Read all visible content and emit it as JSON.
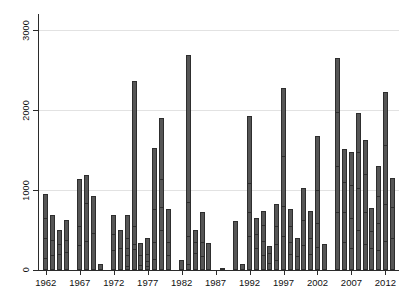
{
  "chart_data": {
    "type": "bar",
    "title": "",
    "subtitle": "",
    "xlabel": "",
    "ylabel": "",
    "grid": true,
    "legend": "none",
    "stacked": true,
    "xlim": [
      1961,
      2014
    ],
    "ylim": [
      0,
      3200
    ],
    "ytick_values": [
      0,
      1000,
      2000,
      3000
    ],
    "ytick_labels": [
      "0",
      "1000",
      "2000",
      "3000"
    ],
    "xtick_values": [
      1962,
      1967,
      1972,
      1977,
      1982,
      1987,
      1992,
      1997,
      2002,
      2007,
      2012
    ],
    "xtick_labels": [
      "1962",
      "1967",
      "1972",
      "1977",
      "1982",
      "1987",
      "1992",
      "1997",
      "2002",
      "2007",
      "2012"
    ],
    "bar_fill_color": "#565656",
    "bar_border_color": "#2e2e2e",
    "gridline_color": "#e2e2e2",
    "axis_color": "#2b2b2b",
    "categories": [
      1962,
      1963,
      1964,
      1965,
      1966,
      1967,
      1968,
      1969,
      1970,
      1971,
      1972,
      1973,
      1974,
      1975,
      1976,
      1977,
      1978,
      1979,
      1980,
      1981,
      1982,
      1983,
      1984,
      1985,
      1986,
      1987,
      1988,
      1989,
      1990,
      1991,
      1992,
      1993,
      1994,
      1995,
      1996,
      1997,
      1998,
      1999,
      2000,
      2001,
      2002,
      2003,
      2004,
      2005,
      2006,
      2007,
      2008,
      2009,
      2010,
      2011,
      2012,
      2013
    ],
    "values": [
      950,
      690,
      500,
      620,
      0,
      1140,
      1190,
      920,
      70,
      0,
      690,
      500,
      690,
      2360,
      340,
      400,
      1530,
      1900,
      760,
      0,
      130,
      2690,
      500,
      720,
      340,
      0,
      20,
      0,
      610,
      80,
      1930,
      650,
      740,
      300,
      830,
      2270,
      760,
      400,
      1030,
      740,
      1680,
      320,
      0,
      2650,
      1510,
      1480,
      1960,
      1620,
      770,
      1300,
      2230,
      1150
    ],
    "segment_breaks": [
      [
        130,
        380,
        620
      ],
      [
        160,
        350
      ],
      [
        170,
        300
      ],
      [
        200,
        350
      ],
      [],
      [
        290,
        520
      ],
      [
        340,
        810
      ],
      [
        440
      ],
      [],
      [],
      [
        230,
        430
      ],
      [
        250
      ],
      [
        30,
        160,
        250,
        380
      ],
      [
        240,
        300,
        520
      ],
      [
        40,
        160
      ],
      [
        20,
        90,
        180
      ],
      [
        110,
        320,
        740
      ],
      [
        470,
        760,
        1110
      ],
      [
        160,
        330
      ],
      [],
      [],
      [
        50,
        400,
        820
      ],
      [
        190,
        330
      ],
      [
        150,
        330
      ],
      [],
      [],
      [],
      [],
      [],
      [],
      [
        400,
        700,
        1060
      ],
      [
        250,
        430
      ],
      [
        160,
        340,
        540
      ],
      [
        60,
        190
      ],
      [
        100,
        300,
        520
      ],
      [
        400,
        780,
        1400
      ],
      [
        180,
        330,
        520
      ],
      [
        150
      ],
      [
        290,
        600
      ],
      [
        180,
        380
      ],
      [
        260,
        560,
        970
      ],
      [],
      [],
      [
        700,
        1270,
        1950
      ],
      [
        330,
        700,
        1080
      ],
      [
        250,
        620,
        1040
      ],
      [
        480,
        1000,
        1450
      ],
      [
        300,
        700,
        1180
      ],
      [
        250,
        460
      ],
      [
        220,
        560,
        900
      ],
      [
        340,
        800,
        1540
      ],
      [
        380,
        760
      ]
    ]
  }
}
